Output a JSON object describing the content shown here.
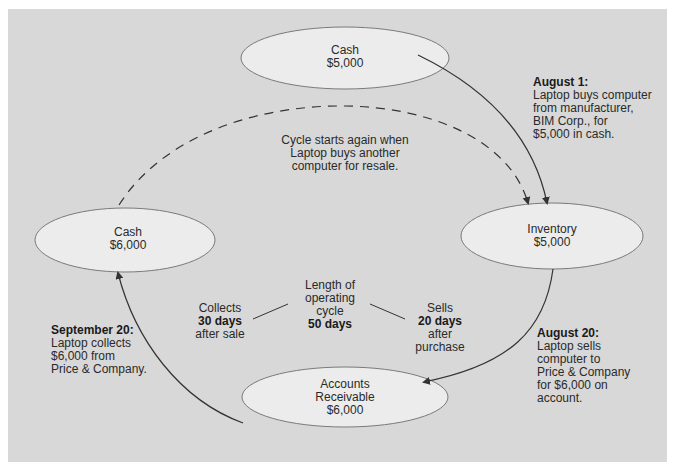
{
  "diagram": {
    "type": "operating-cycle",
    "colors": {
      "background": "#d8d8d8",
      "node_fill": "#ececec",
      "node_stroke": "#7a7a7a",
      "arrow": "#333333"
    },
    "nodes": {
      "cash_start": {
        "title": "Cash",
        "amount": "$5,000"
      },
      "inventory": {
        "title": "Inventory",
        "amount": "$5,000"
      },
      "accounts_receivable": {
        "title_line1": "Accounts",
        "title_line2": "Receivable",
        "amount": "$6,000"
      },
      "cash_end": {
        "title": "Cash",
        "amount": "$6,000"
      }
    },
    "events": {
      "aug1": {
        "date": "August 1:",
        "lines": [
          "Laptop buys computer",
          "from manufacturer,",
          "BIM Corp., for",
          "$5,000 in cash."
        ]
      },
      "aug20": {
        "date": "August 20:",
        "lines": [
          "Laptop sells",
          "computer to",
          "Price & Company",
          "for $6,000 on",
          "account."
        ]
      },
      "sep20": {
        "date": "September 20:",
        "lines": [
          "Laptop collects",
          "$6,000 from",
          "Price & Company."
        ]
      }
    },
    "cycle_restart": {
      "lines": [
        "Cycle starts again when",
        "Laptop buys another",
        "computer for resale."
      ]
    },
    "center": {
      "length": {
        "lines": [
          "Length of",
          "operating",
          "cycle"
        ],
        "value": "50 days"
      },
      "collects": {
        "line1": "Collects",
        "value": "30 days",
        "line3": "after sale"
      },
      "sells": {
        "line1": "Sells",
        "value": "20 days",
        "line3": "after",
        "line4": "purchase"
      }
    }
  }
}
